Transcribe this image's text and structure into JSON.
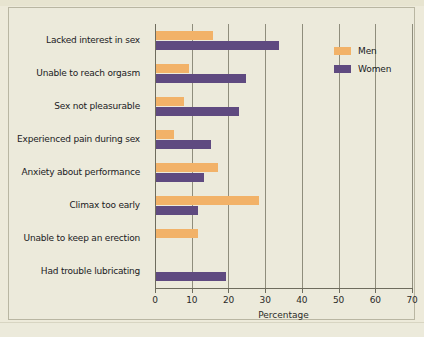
{
  "chart_data": {
    "type": "bar",
    "orientation": "horizontal",
    "title": "",
    "xlabel": "Percentage",
    "ylabel": "",
    "xlim": [
      0,
      70
    ],
    "xticks": [
      0,
      10,
      20,
      30,
      40,
      50,
      60,
      70
    ],
    "grid": true,
    "legend_position": "top-right",
    "categories": [
      "Lacked interest in sex",
      "Unable to reach orgasm",
      "Sex not pleasurable",
      "Experienced pain during sex",
      "Anxiety about performance",
      "Climax too early",
      "Unable to keep an erection",
      "Had trouble lubricating"
    ],
    "series": [
      {
        "name": "Men",
        "color": "#f2b268",
        "values": [
          15.5,
          9.0,
          7.5,
          5.0,
          17.0,
          28.0,
          11.5,
          null
        ]
      },
      {
        "name": "Women",
        "color": "#5f4a80",
        "values": [
          33.5,
          24.5,
          22.5,
          15.0,
          13.0,
          11.5,
          null,
          19.0
        ]
      }
    ]
  },
  "legend": {
    "items": [
      {
        "label": "Men",
        "color": "#f2b268"
      },
      {
        "label": "Women",
        "color": "#5f4a80"
      }
    ]
  },
  "colors": {
    "background": "#edeada",
    "panel": "#eceadb",
    "frame_border": "#b9b6a2",
    "axis": "#6e6c5d",
    "gridline": "#8f8d7c",
    "men": "#f2b268",
    "women": "#5f4a80",
    "text": "#20201d"
  }
}
